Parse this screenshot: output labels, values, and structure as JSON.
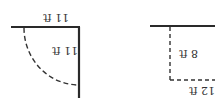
{
  "diagram": {
    "figures": [
      {
        "id": "left",
        "shape": "quarter-circle sector",
        "labels": {
          "top_edge": "11 ft",
          "right_edge": "11 ft"
        }
      },
      {
        "id": "right",
        "shape": "rectangle",
        "labels": {
          "left_edge": "8 ft",
          "bottom_edge": "12 ft"
        }
      }
    ],
    "text_orientation": "rotated 180°",
    "colors": {
      "solid_line": "#2a2a2a",
      "dashed_line": "#333333",
      "text": "#333333"
    }
  }
}
